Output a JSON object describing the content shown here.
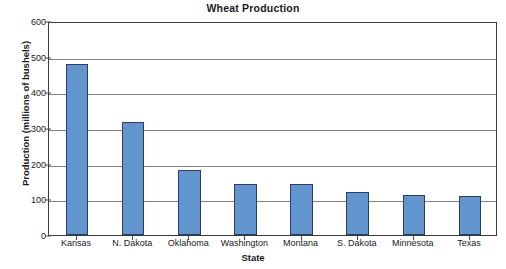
{
  "chart_data": {
    "type": "bar",
    "title": "Wheat Production",
    "xlabel": "State",
    "ylabel": "Production (millions of bushels)",
    "categories": [
      "Kansas",
      "N. Dakota",
      "Oklahoma",
      "Washington",
      "Montana",
      "S. Dakota",
      "Minnesota",
      "Texas"
    ],
    "values": [
      480,
      318,
      183,
      144,
      143,
      122,
      113,
      110
    ],
    "ylim": [
      0,
      600
    ],
    "yticks": [
      0,
      100,
      200,
      300,
      400,
      500,
      600
    ],
    "ytick_labels": [
      "0",
      "100",
      "200",
      "300",
      "400",
      "500",
      "600"
    ],
    "grid": true,
    "legend": false,
    "series_name": "Wheat Production",
    "colors": {
      "bar_fill": "#6295cd",
      "bar_border": "#2b3e63",
      "gridline": "#808080",
      "axis": "#3a3a3a",
      "text": "#1a1a1a",
      "background": "#ffffff"
    }
  }
}
